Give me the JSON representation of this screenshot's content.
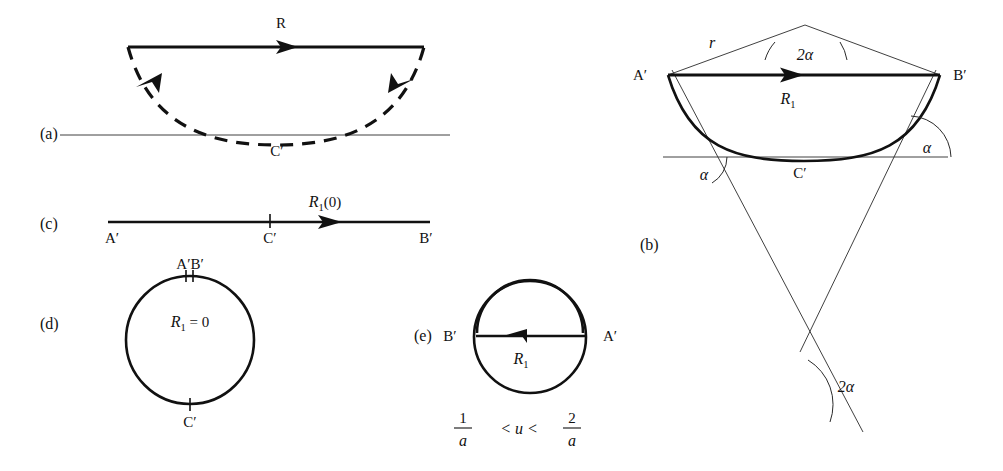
{
  "figure": {
    "width": 1003,
    "height": 471,
    "background": "#ffffff",
    "ink": "#111111"
  },
  "panels": {
    "a": {
      "key": "(a)",
      "key_x": 40,
      "key_y": 139,
      "labels": {
        "vector_R": "R",
        "point_C": "C′"
      },
      "chord": {
        "x1": 128,
        "y1": 47,
        "x2": 424,
        "y2": 47
      },
      "baseline": {
        "x1": 60,
        "y1": 135,
        "x2": 450,
        "y2": 135
      },
      "arc": {
        "start_x": 128,
        "start_y": 47,
        "end_x": 424,
        "end_y": 47,
        "bottom_y": 139
      },
      "R_label_x": 281,
      "R_label_y": 28,
      "C_label_x": 277,
      "C_label_y": 156
    },
    "b": {
      "key": "(b)",
      "key_x": 640,
      "key_y": 250,
      "labels": {
        "point_A": "A′",
        "point_B": "B′",
        "point_C": "C′",
        "radius_r": "r",
        "angle_apex": "2α",
        "angle_left": "α",
        "angle_right": "α",
        "angle_bottom": "2α",
        "vector_R1": "R",
        "vector_R1_sub": "1"
      },
      "apex": {
        "x": 805,
        "y": 25
      },
      "A": {
        "x": 668,
        "y": 75
      },
      "B": {
        "x": 940,
        "y": 75
      },
      "baseline": {
        "x1": 663,
        "y1": 157,
        "x2": 948,
        "y2": 157
      },
      "arc_bottom_y": 160,
      "A_label_x": 640,
      "A_label_y": 80,
      "B_label_x": 948,
      "B_label_y": 80,
      "C_label_x": 790,
      "C_label_y": 178,
      "r_label_x": 712,
      "r_label_y": 48,
      "apex_angle_label_x": 795,
      "apex_angle_label_y": 58,
      "R1_label_x": 788,
      "R1_label_y": 103,
      "alpha_left_x": 708,
      "alpha_left_y": 178,
      "alpha_right_x": 925,
      "alpha_right_y": 152,
      "bottom_angle_x": 845,
      "bottom_angle_y": 388
    },
    "c": {
      "key": "(c)",
      "key_x": 40,
      "key_y": 229,
      "labels": {
        "point_A": "A′",
        "point_B": "B′",
        "point_C": "C′",
        "vector_R1": "R",
        "vector_R1_sub": "1",
        "vector_R1_arg": "(0)"
      },
      "line": {
        "x1": 108,
        "y1": 222,
        "x2": 430,
        "y2": 222
      },
      "tick_x": 270,
      "A_label_x": 104,
      "A_label_y": 241,
      "B_label_x": 420,
      "B_label_y": 241,
      "C_label_x": 263,
      "C_label_y": 241,
      "R1_label_x": 325,
      "R1_label_y": 207
    },
    "d": {
      "key": "(d)",
      "key_x": 40,
      "key_y": 329,
      "labels": {
        "point_AB": "A′B′",
        "point_C": "C′",
        "equation_R1": "R",
        "equation_sub": "1",
        "equation_rest": " = 0"
      },
      "circle": {
        "cx": 190,
        "cy": 340,
        "r": 64
      },
      "AB_label_x": 163,
      "AB_label_y": 269,
      "C_label_x": 181,
      "C_label_y": 425,
      "eq_label_x": 155,
      "eq_label_y": 326
    },
    "e": {
      "key": "(e)",
      "key_x": 414,
      "key_y": 341,
      "labels": {
        "point_A": "A′",
        "point_B": "B′",
        "vector_R1": "R",
        "vector_R1_sub": "1",
        "ineq_num1": "1",
        "ineq_den1": "a",
        "ineq_mid": "< u <",
        "ineq_num2": "2",
        "ineq_den2": "a"
      },
      "circle": {
        "cx": 530,
        "cy": 337,
        "r": 56
      },
      "chord_y": 336,
      "chord_x1": 476,
      "chord_x2": 584,
      "A_label_x": 594,
      "A_label_y": 341,
      "B_label_x": 444,
      "B_label_y": 341,
      "R1_label_x": 506,
      "R1_label_y": 362,
      "ineq_x": 455,
      "ineq_y": 428
    }
  }
}
